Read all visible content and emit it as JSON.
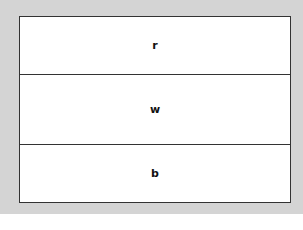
{
  "diagram": {
    "sections": [
      {
        "label": "r"
      },
      {
        "label": "w"
      },
      {
        "label": "b"
      }
    ]
  }
}
